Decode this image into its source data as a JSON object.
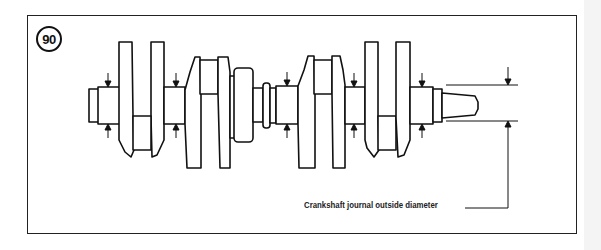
{
  "figure": {
    "number": "90",
    "caption": "Crankshaft journal outside diameter",
    "subject": "crankshaft",
    "annotations": [
      {
        "type": "measurement-arrows",
        "count": 7,
        "meaning": "journal outside diameter measuring points"
      }
    ]
  }
}
